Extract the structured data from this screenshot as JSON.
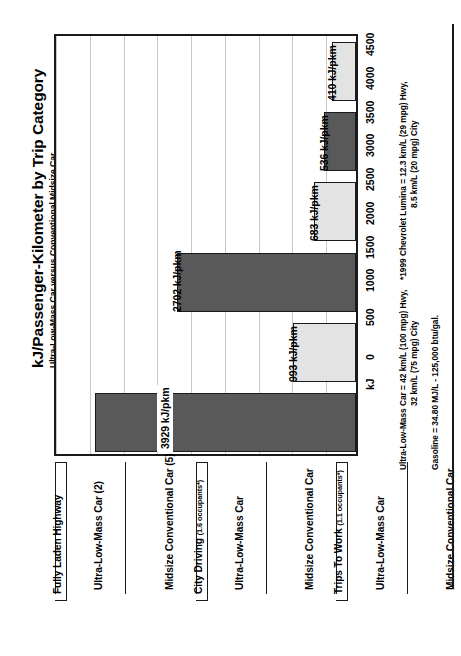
{
  "chart_data": {
    "type": "bar",
    "title": "kJ/Passenger-Kilometer by Trip Category",
    "subtitle": "Ultra-Low-Mass Car versus Conventional Midsize Car",
    "orientation": "vertical-rotated-90ccw",
    "xlabel": "",
    "ylabel": "kJ",
    "ylim": [
      0,
      4500
    ],
    "grid": true,
    "legend_position": "none",
    "categories": [
      "Ultra-Low-Mass Car (2)",
      "Midsize Conventional Car (5)",
      "Ultra-Low-Mass Car",
      "Midsize Conventional Car",
      "Ultra-Low-Mass Car",
      "Midsize Conventional Car"
    ],
    "values": [
      410,
      536,
      683,
      2702,
      993,
      3929
    ],
    "value_labels": [
      "410 kJ/pkm",
      "536 kJ/pkm",
      "683 kJ/pkm",
      "2702 kJ/pkm",
      "993 kJ/pkm",
      "3929 kJ/pkm"
    ],
    "series_colors": [
      "#e3e3e3",
      "#595959",
      "#e3e3e3",
      "#595959",
      "#e3e3e3",
      "#595959"
    ],
    "groups": [
      {
        "label": "Fully Laden Highway",
        "occupants": "",
        "members": [
          0,
          1
        ]
      },
      {
        "label": "City Driving",
        "occupants": "(1.6 occupants*)",
        "members": [
          2,
          3
        ]
      },
      {
        "label": "Trips To Work",
        "occupants": "(1.1 occupants*)",
        "members": [
          4,
          5
        ]
      }
    ],
    "tick_values": [
      0,
      500,
      1000,
      1500,
      2000,
      2500,
      3000,
      3500,
      4000,
      4500
    ],
    "tick_labels": [
      "0",
      "500",
      "1000",
      "1500",
      "2000",
      "2500",
      "3000",
      "3500",
      "4000",
      "4500"
    ],
    "axis_unit": "kJ"
  },
  "annotations": {
    "occupancy_footnote": "* NPTS Average Occupancy",
    "note_ulmc_line1": "Ultra-Low-Mass Car = 42 km/L (100 mpg) Hwy,",
    "note_ulmc_line2": "32 km/L (75 mpg) City",
    "note_gasoline": "Gasoline = 34.80 MJ/L  -  125,000 btu/gal.",
    "note_lumina_line1": "*1999 Chevrolet Lumina = 12.3 km/L (29 mpg) Hwy,",
    "note_lumina_line2": "8.5 km/L (20 mpg) City"
  },
  "colors": {
    "light_bar": "#e3e3e3",
    "dark_bar": "#595959",
    "frame": "#1a1a1a",
    "gridline": "#c9c9c9",
    "background": "#ffffff"
  }
}
